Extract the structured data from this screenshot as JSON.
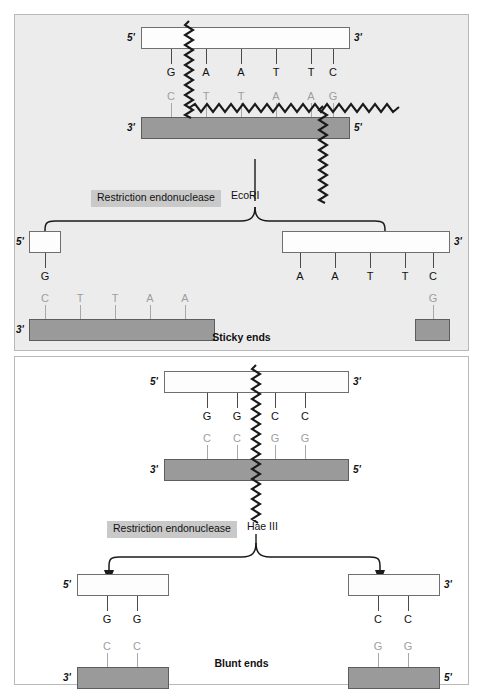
{
  "panels": [
    {
      "id": "sticky",
      "caption": "Sticky ends",
      "enzyme_label": "Restriction endonuclease",
      "enzyme_name": "EcoRI",
      "intact": {
        "top_strand": {
          "five_prime": "5'",
          "three_prime": "3'",
          "bases": [
            "G",
            "A",
            "A",
            "T",
            "T",
            "C"
          ]
        },
        "bottom_strand": {
          "three_prime": "3'",
          "five_prime": "5'",
          "bases": [
            "C",
            "T",
            "T",
            "A",
            "A",
            "G"
          ]
        }
      },
      "fragments": {
        "left": {
          "top_strand": {
            "five_prime": "5'",
            "bases": [
              "G"
            ]
          },
          "bottom_strand": {
            "three_prime": "3'",
            "bases": [
              "C",
              "T",
              "T",
              "A",
              "A"
            ]
          }
        },
        "right": {
          "top_strand": {
            "three_prime": "3'",
            "bases": [
              "A",
              "A",
              "T",
              "T",
              "C"
            ]
          },
          "bottom_strand": {
            "bases": [
              "G"
            ]
          }
        }
      }
    },
    {
      "id": "blunt",
      "caption": "Blunt ends",
      "enzyme_label": "Restriction endonuclease",
      "enzyme_name": "Hae III",
      "intact": {
        "top_strand": {
          "five_prime": "5'",
          "three_prime": "3'",
          "bases": [
            "G",
            "G",
            "C",
            "C"
          ]
        },
        "bottom_strand": {
          "three_prime": "3'",
          "five_prime": "5'",
          "bases": [
            "C",
            "C",
            "G",
            "G"
          ]
        }
      },
      "fragments": {
        "left": {
          "top_strand": {
            "five_prime": "5'",
            "bases": [
              "G",
              "G"
            ]
          },
          "bottom_strand": {
            "three_prime": "3'",
            "bases": [
              "C",
              "C"
            ]
          }
        },
        "right": {
          "top_strand": {
            "three_prime": "3'",
            "bases": [
              "C",
              "C"
            ]
          },
          "bottom_strand": {
            "five_prime": "5'",
            "bases": [
              "G",
              "G"
            ]
          }
        }
      }
    }
  ],
  "colors": {
    "panel_top_background": "#ececec",
    "panel_bottom_background": "#ffffff",
    "top_strand_fill": "#fdfdfd",
    "bottom_strand_fill": "#9a9a9a",
    "enzyme_chip_background": "#c9c9c9",
    "stroke": "#4a4a4a",
    "faded_text": "#9e9e9e"
  }
}
